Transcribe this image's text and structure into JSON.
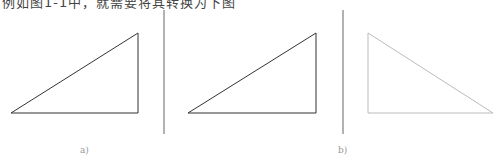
{
  "header": {
    "cropped_text": "例如图1-1中，就需要将其转换为下图"
  },
  "figure": {
    "panels": [
      {
        "id": "a",
        "label": "a)",
        "triangle": [
          [
            11,
            113
          ],
          [
            138,
            113
          ],
          [
            138,
            33
          ]
        ],
        "stroke": "#333333"
      },
      {
        "id": "b",
        "label": "b)",
        "triangle": [
          [
            188,
            113
          ],
          [
            316,
            113
          ],
          [
            316,
            33
          ]
        ],
        "stroke": "#333333"
      },
      {
        "id": "c",
        "label": "",
        "triangle": [
          [
            368,
            33
          ],
          [
            368,
            113
          ],
          [
            493,
            113
          ]
        ],
        "stroke": "#bbbbbb"
      }
    ],
    "dividers": [
      {
        "x": 164,
        "y1": 10,
        "y2": 134
      },
      {
        "x": 343,
        "y1": 10,
        "y2": 134
      }
    ]
  }
}
